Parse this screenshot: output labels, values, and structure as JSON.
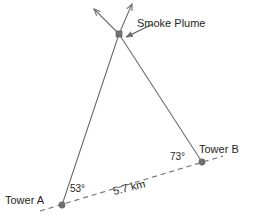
{
  "diagram": {
    "type": "trigonometry-triangulation-diagram",
    "background_color": "#ffffff",
    "line_color": "#6d6e71",
    "text_color": "#231f20",
    "labels": {
      "smoke_plume": "Smoke Plume",
      "tower_a": "Tower A",
      "tower_b": "Tower B",
      "angle_a": "53°",
      "angle_b": "73°",
      "baseline_distance": "5.7 km"
    },
    "points": {
      "smoke_plume": {
        "x": 119,
        "y": 34
      },
      "tower_a": {
        "x": 62,
        "y": 205
      },
      "tower_b": {
        "x": 202,
        "y": 162
      }
    },
    "segments": [
      {
        "name": "tower-a-to-plume",
        "from": "tower_a",
        "to": "smoke_plume",
        "style": "solid",
        "arrow_extension": true
      },
      {
        "name": "tower-b-to-plume",
        "from": "tower_b",
        "to": "smoke_plume",
        "style": "solid",
        "arrow_extension": true
      },
      {
        "name": "baseline-a-to-b",
        "from": "tower_a",
        "to": "tower_b",
        "style": "dashed",
        "arrow_extension": false
      }
    ],
    "arrow_tips": {
      "upper_right": {
        "x": 131,
        "y": 3
      },
      "upper_left": {
        "x": 93,
        "y": 8
      }
    },
    "pointer": {
      "name": "smoke-plume-pointer",
      "from": {
        "x": 152,
        "y": 25
      },
      "to": {
        "x": 125,
        "y": 38
      }
    },
    "baseline_dash_extent": {
      "x1": 40,
      "y1": 211,
      "x2": 223,
      "y2": 156
    }
  }
}
